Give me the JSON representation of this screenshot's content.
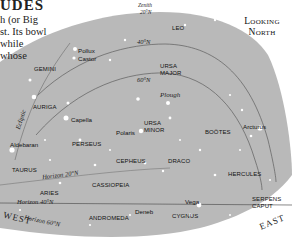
{
  "intro": {
    "title": "UDES",
    "lines": [
      "h (or Big",
      "st. Its bowl",
      " while",
      "whose"
    ]
  },
  "header": {
    "looking_line1": "Looking",
    "looking_line2": "North"
  },
  "annotations": {
    "zenith_line1": "Zenith",
    "zenith_line2": "20°N",
    "lat40": "40°N",
    "lat60": "60°N",
    "plough": "Plough",
    "ecliptic": "Ecliptic",
    "horizon20": "Horizon 20°N",
    "horizon40": "Horizon 40°N",
    "horizon60": "Horizon 60°N",
    "west": "WEST",
    "east": "EAST"
  },
  "constellations": {
    "leo": "LEO",
    "gemini": "GEMINI",
    "ursa_major_1": "URSA",
    "ursa_major_2": "MAJOR",
    "auriga": "AURIGA",
    "perseus": "PERSEUS",
    "ursa_minor_1": "URSA",
    "ursa_minor_2": "MINOR",
    "bootes": "BOÖTES",
    "taurus": "TAURUS",
    "cepheus": "CEPHEUS",
    "draco": "DRACO",
    "hercules": "HERCULES",
    "aries": "ARIES",
    "cassiopeia": "CASSIOPEIA",
    "andromeda": "ANDROMEDA",
    "cygnus": "CYGNUS",
    "serpens_1": "SERPENS",
    "serpens_2": "CAPUT"
  },
  "stars": {
    "pollux": "Pollux",
    "castor": "Castor",
    "capella": "Capella",
    "polaris": "Polaris",
    "arcturus": "Arcturus",
    "aldebaran": "Aldebaran",
    "vega": "Vega",
    "deneb": "Deneb"
  },
  "colors": {
    "sky": "#b9b9b9",
    "lines": "#5a5a5a",
    "stars": "#ffffff",
    "text": "#111111",
    "page": "#ffffff"
  }
}
